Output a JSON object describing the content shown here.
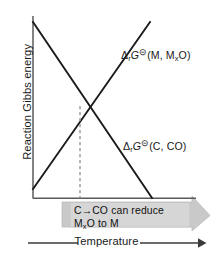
{
  "figure": {
    "axes": {
      "y_title": "Reaction Gibbs energy",
      "x_title": "Temperature",
      "x_arrow_icon": "right-arrow-icon",
      "axis_color": "#555555"
    },
    "curves": [
      {
        "id": "metal-oxide-line",
        "label_delta": "Δ",
        "label_sub_r": "r",
        "label_G": "G",
        "label_standard": "⊝",
        "label_species_pre": "(M,  M",
        "label_species_sub": "x",
        "label_species_post": "O)",
        "label_plain": "ΔrG⊝ (M, MxO)",
        "direction": "rising",
        "color": "#1a1a1a",
        "x1": 33,
        "y1": 189,
        "x2": 150,
        "y2": 22
      },
      {
        "id": "carbon-co-line",
        "label_delta": "Δ",
        "label_sub_r": "r",
        "label_G": "G",
        "label_standard": "⊝",
        "label_species_pre": "(C,  CO)",
        "label_species_sub": "",
        "label_species_post": "",
        "label_plain": "ΔrG⊝ (C, CO)",
        "direction": "falling",
        "color": "#1a1a1a",
        "x1": 33,
        "y1": 22,
        "x2": 152,
        "y2": 198
      }
    ],
    "intersection": {
      "x": 80,
      "y": 106,
      "dashed_drop_to_y": 198,
      "dash_color": "#8a8a8a"
    },
    "callout": {
      "id": "reduction-arrow",
      "line1_pre": "C",
      "line1_arrow": "→",
      "line1_post": "CO  can  reduce",
      "line2_pre": "M",
      "line2_sub": "x",
      "line2_post": "O  to  M",
      "text_plain": "C→CO can reduce MxO to M",
      "fill": "#c9c9c9",
      "stroke": "#b0b0b0"
    },
    "colors": {
      "background": "#ffffff",
      "ink": "#1a1a1a",
      "gray_band": "#c9c9c9",
      "axis": "#555555"
    }
  }
}
